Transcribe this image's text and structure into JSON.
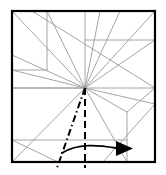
{
  "figure": {
    "kind": "origami-crease-pattern",
    "title": "",
    "caption": "",
    "colors": {
      "paper_edge": "#000000",
      "crease_line": "#9a9a9a",
      "mountain_line": "#000000",
      "valley_line": "#000000",
      "arrow": "#000000",
      "background": "#ffffff"
    },
    "square": {
      "x0": 12,
      "y0": 11,
      "x1": 155,
      "y1": 162,
      "stroke_width": 2.2
    },
    "apex": {
      "x": 85,
      "y": 88,
      "label": "convergence-point"
    },
    "creases": [
      {
        "name": "crease-vertical-left",
        "type": "line",
        "x1": 47,
        "y1": 11,
        "x2": 47,
        "y2": 70
      },
      {
        "name": "crease-vertical-center-top",
        "type": "line",
        "x1": 85,
        "y1": 11,
        "x2": 85,
        "y2": 88
      },
      {
        "name": "crease-vertical-right-lower",
        "type": "line",
        "x1": 127,
        "y1": 112,
        "x2": 127,
        "y2": 162
      },
      {
        "name": "crease-horizontal-mid",
        "type": "line",
        "x1": 12,
        "y1": 88,
        "x2": 155,
        "y2": 88
      },
      {
        "name": "crease-horizontal-upper-right",
        "type": "line",
        "x1": 85,
        "y1": 40,
        "x2": 155,
        "y2": 40
      },
      {
        "name": "crease-horizontal-left-upper",
        "type": "line",
        "x1": 12,
        "y1": 70,
        "x2": 47,
        "y2": 70
      },
      {
        "name": "crease-horizontal-lower",
        "type": "line",
        "x1": 12,
        "y1": 140,
        "x2": 127,
        "y2": 140
      },
      {
        "name": "crease-diag-tl-to-apex",
        "type": "line",
        "x1": 12,
        "y1": 11,
        "x2": 85,
        "y2": 88
      },
      {
        "name": "crease-diag-topleft-long",
        "type": "line",
        "x1": 32,
        "y1": 11,
        "x2": 155,
        "y2": 88
      },
      {
        "name": "crease-diag-left70-to-apex",
        "type": "line",
        "x1": 12,
        "y1": 70,
        "x2": 85,
        "y2": 88
      },
      {
        "name": "crease-diag-left88-to-apex",
        "type": "line",
        "x1": 12,
        "y1": 88,
        "x2": 85,
        "y2": 88
      },
      {
        "name": "crease-diag-apex-to-top-a",
        "type": "line",
        "x1": 85,
        "y1": 88,
        "x2": 100,
        "y2": 11
      },
      {
        "name": "crease-diag-apex-to-top-b",
        "type": "line",
        "x1": 85,
        "y1": 88,
        "x2": 120,
        "y2": 11
      },
      {
        "name": "crease-diag-apex-to-topright",
        "type": "line",
        "x1": 85,
        "y1": 88,
        "x2": 155,
        "y2": 11
      },
      {
        "name": "crease-diag-apex-to-right40",
        "type": "line",
        "x1": 85,
        "y1": 88,
        "x2": 155,
        "y2": 40
      },
      {
        "name": "crease-diag-apex-to-right104",
        "type": "line",
        "x1": 85,
        "y1": 88,
        "x2": 155,
        "y2": 104
      },
      {
        "name": "crease-diag-apex-to-j127",
        "type": "line",
        "x1": 85,
        "y1": 88,
        "x2": 127,
        "y2": 112
      },
      {
        "name": "crease-diag-j127-to-right88",
        "type": "line",
        "x1": 127,
        "y1": 112,
        "x2": 155,
        "y2": 88
      },
      {
        "name": "crease-diag-apex-to-bl",
        "type": "line",
        "x1": 85,
        "y1": 88,
        "x2": 12,
        "y2": 162
      },
      {
        "name": "crease-diag-apex-to-bottom127",
        "type": "line",
        "x1": 85,
        "y1": 88,
        "x2": 127,
        "y2": 162
      },
      {
        "name": "crease-diag-br-to-right104",
        "type": "line",
        "x1": 155,
        "y1": 104,
        "x2": 103,
        "y2": 162
      },
      {
        "name": "crease-diag-bl140-to-b100",
        "type": "line",
        "x1": 12,
        "y1": 140,
        "x2": 58,
        "y2": 162
      },
      {
        "name": "crease-diag-apex-to-top-c",
        "type": "line",
        "x1": 85,
        "y1": 88,
        "x2": 47,
        "y2": 11
      },
      {
        "name": "crease-diag-apex-left-fan",
        "type": "line",
        "x1": 85,
        "y1": 88,
        "x2": 12,
        "y2": 55
      }
    ],
    "fold_lines": [
      {
        "name": "mountain-fold-dashdot",
        "style": "dash-dot",
        "x1": 85,
        "y1": 88,
        "x2": 57,
        "y2": 168,
        "stroke_width": 2.0
      },
      {
        "name": "valley-fold-dashed",
        "style": "dashed",
        "x1": 85,
        "y1": 88,
        "x2": 85,
        "y2": 168,
        "stroke_width": 2.0
      }
    ],
    "arrow": {
      "name": "fold-direction-arrow",
      "path": "M 62,153 C 78,143 98,145 116,148",
      "head": "M 116,141 L 133,148.5 L 116,156 Z",
      "stroke_width": 1.8
    }
  }
}
